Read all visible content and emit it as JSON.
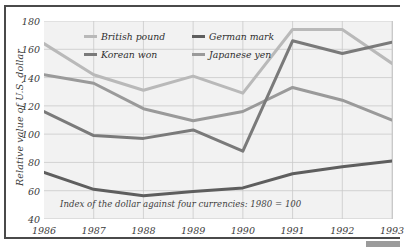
{
  "chart_data": {
    "type": "line",
    "title": "",
    "subtitle": "",
    "xlabel": "",
    "ylabel": "Relative value of U.S. dollar",
    "annotation": "Index of the dollar against four currencies: 1980 = 100",
    "categories": [
      "1986",
      "1987",
      "1988",
      "1989",
      "1990",
      "1991",
      "1992",
      "1993"
    ],
    "x": [
      1986,
      1987,
      1988,
      1989,
      1990,
      1991,
      1992,
      1993
    ],
    "ylim": [
      40,
      180
    ],
    "yticks": [
      40,
      60,
      80,
      100,
      120,
      140,
      160,
      180
    ],
    "grid": true,
    "legend_position": "top-center",
    "series": [
      {
        "name": "British pound",
        "color": "#b9b9b9",
        "values": [
          164,
          142,
          131,
          141,
          129,
          174,
          174,
          150
        ]
      },
      {
        "name": "German mark",
        "color": "#5e5e5e",
        "values": [
          73,
          61,
          56.5,
          59.5,
          62,
          72,
          77,
          81
        ]
      },
      {
        "name": "Korean won",
        "color": "#7a7a7a",
        "values": [
          116,
          99,
          97,
          103,
          88,
          166,
          157,
          165
        ]
      },
      {
        "name": "Japanese yen",
        "color": "#9a9a9a",
        "values": [
          142,
          136,
          118,
          109.5,
          116,
          133,
          124,
          110
        ]
      }
    ]
  },
  "ytick_labels": [
    "180",
    "160",
    "140",
    "120",
    "100",
    "80",
    "60",
    "40"
  ],
  "legend": {
    "items": [
      {
        "label": "British pound"
      },
      {
        "label": "German mark"
      },
      {
        "label": "Korean won"
      },
      {
        "label": "Japanese yen"
      }
    ]
  }
}
